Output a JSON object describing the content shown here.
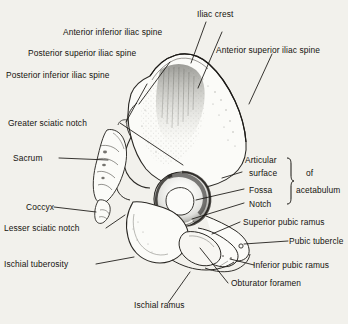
{
  "figure": {
    "background_color": "#f2f1ec",
    "ink_color": "#15130f",
    "bone_fill": "#fbfbf8",
    "shading_color": "#8e8e88"
  },
  "labels": {
    "iliac_crest": "Iliac crest",
    "anterior_inferior_iliac_spine": "Anterior inferior iliac spine",
    "posterior_superior_iliac_spine": "Posterior superior iliac spine",
    "anterior_superior_iliac_spine": "Anterior superior iliac spine",
    "posterior_inferior_iliac_spine": "Posterior inferior iliac spine",
    "greater_sciatic_notch": "Greater sciatic notch",
    "sacrum": "Sacrum",
    "coccyx": "Coccyx",
    "lesser_sciatic_notch": "Lesser sciatic notch",
    "ischial_tuberosity": "Ischial tuberosity",
    "articular_surface_line1": "Articular",
    "articular_surface_line2": "surface",
    "fossa": "Fossa",
    "notch": "Notch",
    "of": "of",
    "acetabulum": "acetabulum",
    "superior_pubic_ramus": "Superior pubic ramus",
    "pubic_tubercle": "Pubic tubercle",
    "inferior_pubic_ramus": "Inferior pubic ramus",
    "obturator_foramen": "Obturator foramen",
    "ischial_ramus": "Ischial ramus"
  },
  "structures": {
    "ilium": "ilium-wing",
    "acetabulum": "acetabulum-socket",
    "obturator_foramen": "obturator-foramen-opening",
    "sacrum": "sacrum-column",
    "coccyx": "coccyx-tip",
    "ischial_tuberosity": "ischial-tuberosity-mass",
    "pubis": "pubic-body"
  }
}
